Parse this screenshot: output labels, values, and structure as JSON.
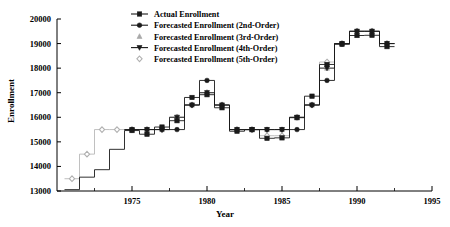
{
  "chart_data": {
    "type": "line",
    "title": "",
    "xlabel": "Year",
    "ylabel": "Enrollment",
    "xlim": [
      1970,
      1995
    ],
    "ylim": [
      13000,
      20000
    ],
    "xticks": [
      1975,
      1980,
      1985,
      1990,
      1995
    ],
    "yticks": [
      13000,
      14000,
      15000,
      16000,
      17000,
      18000,
      19000,
      20000
    ],
    "grid": false,
    "legend_position": "top-center",
    "x": [
      1971,
      1972,
      1973,
      1974,
      1975,
      1976,
      1977,
      1978,
      1979,
      1980,
      1981,
      1982,
      1983,
      1984,
      1985,
      1986,
      1987,
      1988,
      1989,
      1990,
      1991,
      1992
    ],
    "series": [
      {
        "name": "Actual Enrollment",
        "marker": "square-filled",
        "color": "#1a1a1a",
        "values": [
          13055,
          13563,
          13867,
          14696,
          15460,
          15311,
          15603,
          15861,
          16807,
          16919,
          16388,
          15433,
          15497,
          15145,
          15163,
          15984,
          16859,
          18150,
          18970,
          19328,
          19337,
          18876
        ]
      },
      {
        "name": "Forecasted Enrollment (2nd-Order)",
        "marker": "circle-filled",
        "color": "#1a1a1a",
        "values": [
          null,
          null,
          null,
          null,
          15500,
          15500,
          15500,
          15500,
          16500,
          17500,
          16500,
          15500,
          15500,
          15500,
          15500,
          15500,
          16500,
          17500,
          19000,
          19500,
          19500,
          19000
        ]
      },
      {
        "name": "Forecasted Enrollment (3rd-Order)",
        "marker": "triangle-up",
        "color": "#9a9a9a",
        "values": [
          null,
          null,
          null,
          null,
          15500,
          15500,
          15500,
          16000,
          16500,
          17000,
          16500,
          15500,
          15500,
          15500,
          15500,
          16000,
          16500,
          18000,
          19000,
          19500,
          19500,
          19000
        ]
      },
      {
        "name": "Forecasted Enrollment (4th-Order)",
        "marker": "triangle-down",
        "color": "#1a1a1a",
        "values": [
          null,
          null,
          null,
          null,
          15500,
          15500,
          15500,
          16000,
          16500,
          17000,
          16500,
          15500,
          15500,
          15500,
          15500,
          16000,
          16500,
          18000,
          19000,
          19500,
          19500,
          19000
        ]
      },
      {
        "name": "Forecasted Enrollment (5th-Order)",
        "marker": "diamond",
        "color": "#b0b0b0",
        "values": [
          13500,
          14500,
          15500,
          15500,
          15500,
          15500,
          15500,
          16000,
          16500,
          17000,
          16500,
          15500,
          15500,
          15250,
          15250,
          16000,
          16500,
          18250,
          19000,
          19500,
          19500,
          19000
        ]
      }
    ]
  },
  "axes": {
    "y_tick_labels": [
      "20000",
      "19000",
      "18000",
      "17000",
      "16000",
      "15000",
      "14000",
      "13000"
    ],
    "x_tick_labels": [
      "1975",
      "1980",
      "1985",
      "1990",
      "1995"
    ],
    "ylabel": "Enrollment",
    "xlabel": "Year"
  },
  "legend": {
    "items": [
      {
        "label": "Actual Enrollment",
        "marker": "square-filled"
      },
      {
        "label": "Forecasted Enrollment (2nd-Order)",
        "marker": "circle-filled"
      },
      {
        "label": "Forecasted Enrollment (3rd-Order)",
        "marker": "triangle-up"
      },
      {
        "label": "Forecasted Enrollment (4th-Order)",
        "marker": "triangle-down"
      },
      {
        "label": "Forecasted Enrollment (5th-Order)",
        "marker": "diamond"
      }
    ]
  }
}
